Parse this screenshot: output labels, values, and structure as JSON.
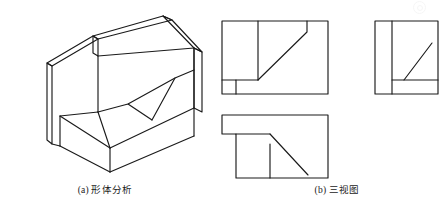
{
  "figure": {
    "background_color": "#ffffff",
    "line_color": "#1a1a1a",
    "width": 444,
    "height": 208
  },
  "captions": {
    "a": "(a) 形体分析",
    "b": "(b) 三视图"
  },
  "pictorial": {
    "label": "isometric-pictorial",
    "description": "Axonometric view of a block with a vertical back wall, a stepped base and an inclined cut face",
    "paths": [
      "M 47,63 L 47,140 L 52,144 L 52,66 Z",
      "M 47,63 L 93,36 L 98,39 L 52,66 Z",
      "M 93,36 L 163,16 L 172,20 L 98,39 Z",
      "M 163,16 L 172,20 L 202,52 L 194,48 Z",
      "M 194,48 L 202,52 L 202,112 L 194,108 Z",
      "M 98,39 L 98,56 L 93,53 L 93,36 Z",
      "M 98,56 L 194,48",
      "M 194,48 L 194,108",
      "M 98,56 L 98,112",
      "M 98,112 L 60,116 L 60,146 L 52,144",
      "M 60,146 L 110,172 L 110,148",
      "M 110,172 L 194,136 L 194,108",
      "M 110,148 L 194,108",
      "M 98,112 L 110,148",
      "M 98,112 L 128,104",
      "M 128,104 L 175,78",
      "M 175,78 L 194,70",
      "M 128,104 L 152,120",
      "M 152,120 L 175,78",
      "M 60,116 L 110,148",
      "M 52,144 L 60,146"
    ]
  },
  "views": {
    "front": {
      "label": "front-view",
      "name": "主视图",
      "outline": [
        222,
        21,
        106,
        73
      ],
      "elements": [
        "vertical-division-line",
        "inclined-edge",
        "lower-left-step-notch"
      ]
    },
    "side": {
      "label": "right-side-view",
      "name": "左视图",
      "outline": [
        375,
        21,
        63,
        73
      ],
      "elements": [
        "vertical-division-line",
        "horizontal-step-line",
        "inclined-edge"
      ]
    },
    "top": {
      "label": "top-view",
      "name": "俯视图",
      "outline": [
        222,
        115,
        106,
        63
      ],
      "elements": [
        "step-notch-outline",
        "vertical-division-line",
        "inclined-edge"
      ]
    }
  },
  "watermark": {
    "label": "faint-circular-watermark",
    "visible": true
  }
}
